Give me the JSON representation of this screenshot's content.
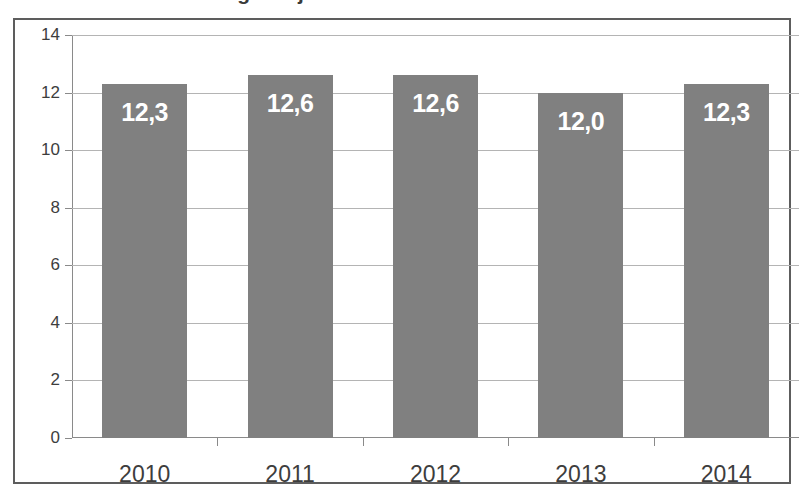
{
  "title_remnant": "Tätigkeitsjahr",
  "chart_data": {
    "type": "bar",
    "title": "",
    "xlabel": "",
    "ylabel": "",
    "categories": [
      "2010",
      "2011",
      "2012",
      "2013",
      "2014"
    ],
    "values": [
      12.3,
      12.6,
      12.6,
      12.0,
      12.3
    ],
    "value_labels": [
      "12,3",
      "12,6",
      "12,6",
      "12,0",
      "12,3"
    ],
    "ylim": [
      0,
      14
    ],
    "yticks": [
      0,
      2,
      4,
      6,
      8,
      10,
      12,
      14
    ],
    "ytick_labels": [
      "0",
      "2",
      "4",
      "6",
      "8",
      "10",
      "12",
      "14"
    ],
    "grid": true,
    "legend": "none",
    "bar_color": "#808080",
    "label_color": "#ffffff",
    "gridline_color": "#b4b4b4",
    "axis_color": "#8a8a8a",
    "frame_color": "#5d5d5d",
    "decimal_separator": ","
  }
}
